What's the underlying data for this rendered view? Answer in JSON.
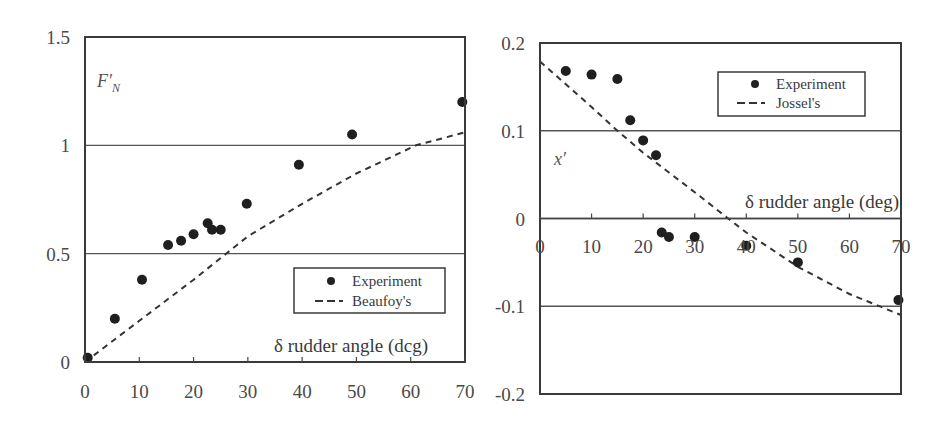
{
  "chart_data": [
    {
      "type": "scatter",
      "title": "",
      "ylabel": "F'_N",
      "ylabel_main": "F'",
      "ylabel_sub": "N",
      "xlabel": "δ rudder angle (deg)",
      "xlabel_display": "δ rudder angle (dcg)",
      "xlim": [
        0,
        70
      ],
      "ylim": [
        0,
        1.5
      ],
      "x_ticks": [
        "0",
        "10",
        "20",
        "30",
        "40",
        "50",
        "60",
        "70"
      ],
      "x_tick_values": [
        0,
        10,
        20,
        30,
        40,
        50,
        60,
        70
      ],
      "y_ticks": [
        "0",
        "0.5",
        "1",
        "1.5"
      ],
      "y_tick_values": [
        0,
        0.5,
        1,
        1.5
      ],
      "gridlines_y": [
        0.5,
        1.0
      ],
      "legend_position": "lower right",
      "series": [
        {
          "name": "Experiment",
          "marker": "filled-circle",
          "x": [
            0.5,
            5.5,
            10.5,
            15.3,
            17.7,
            20.0,
            22.6,
            23.4,
            25.0,
            29.8,
            39.4,
            49.2,
            69.5
          ],
          "y": [
            0.02,
            0.2,
            0.38,
            0.54,
            0.56,
            0.59,
            0.64,
            0.61,
            0.61,
            0.73,
            0.91,
            1.05,
            1.2
          ]
        },
        {
          "name": "Beaufoy's",
          "style": "dashed-line",
          "x": [
            0,
            10,
            20,
            26,
            30,
            40,
            50,
            61,
            70
          ],
          "y": [
            0.0,
            0.19,
            0.38,
            0.5,
            0.58,
            0.73,
            0.87,
            1.0,
            1.06
          ]
        }
      ]
    },
    {
      "type": "scatter",
      "title": "",
      "ylabel": "x'",
      "xlabel": "δ rudder angle (deg)",
      "xlim": [
        0,
        70
      ],
      "ylim": [
        -0.2,
        0.2
      ],
      "x_ticks": [
        "0",
        "10",
        "20",
        "30",
        "40",
        "50",
        "60",
        "70"
      ],
      "x_tick_values": [
        0,
        10,
        20,
        30,
        40,
        50,
        60,
        70
      ],
      "y_ticks": [
        "-0.2",
        "-0.1",
        "0",
        "0.1",
        "0.2"
      ],
      "y_tick_values": [
        -0.2,
        -0.1,
        0,
        0.1,
        0.2
      ],
      "gridlines_y": [
        -0.1,
        0,
        0.1
      ],
      "legend_position": "upper right",
      "series": [
        {
          "name": "Experiment",
          "marker": "filled-circle",
          "x": [
            5.0,
            10.0,
            15.0,
            17.5,
            20.0,
            22.5,
            23.6,
            25.0,
            30.0,
            40.0,
            50.0,
            69.5
          ],
          "y": [
            0.168,
            0.164,
            0.159,
            0.112,
            0.089,
            0.072,
            -0.016,
            -0.021,
            -0.021,
            -0.031,
            -0.05,
            -0.093
          ]
        },
        {
          "name": "Jossel's",
          "style": "dashed-line",
          "x": [
            0,
            10,
            15,
            20,
            30,
            36.5,
            40,
            50,
            60,
            70
          ],
          "y": [
            0.179,
            0.127,
            0.1,
            0.075,
            0.03,
            0.0,
            -0.016,
            -0.055,
            -0.086,
            -0.11
          ]
        }
      ]
    }
  ],
  "left_chart": {
    "legend": {
      "experiment": "Experiment",
      "model": "Beaufoy's"
    },
    "ylabel_main": "F′",
    "ylabel_sub": "N",
    "xlabel": "δ rudder angle (dcg)"
  },
  "right_chart": {
    "legend": {
      "experiment": "Experiment",
      "model": "Jossel's"
    },
    "ylabel": "x′",
    "xlabel": "δ rudder angle (deg)"
  },
  "colors": {
    "marker": "#222222",
    "line": "#3a3a3a",
    "frame": "#3a3a3a",
    "grid": "#555555"
  }
}
